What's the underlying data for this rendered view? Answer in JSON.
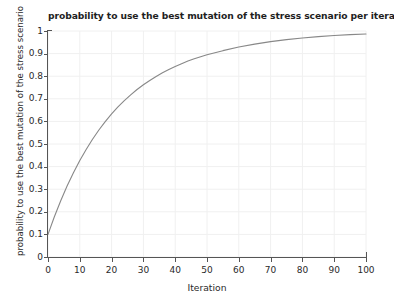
{
  "chart_data": {
    "type": "line",
    "title": "probability to use the best mutation of the stress scenario per iteration",
    "xlabel": "Iteration",
    "ylabel": "probability to use the best mutation of the stress scenario",
    "xlim": [
      0,
      100
    ],
    "ylim": [
      0,
      1
    ],
    "grid": true,
    "legend": "none",
    "line_color": "#888888",
    "xticks": [
      "0",
      "10",
      "20",
      "30",
      "40",
      "50",
      "60",
      "70",
      "80",
      "90",
      "100"
    ],
    "yticks": [
      "0",
      "0.1",
      "0.2",
      "0.3",
      "0.4",
      "0.5",
      "0.6",
      "0.7",
      "0.8",
      "0.9",
      "1"
    ],
    "series": [
      {
        "name": "probability to use the best mutation",
        "x": [
          0,
          2,
          4,
          6,
          8,
          10,
          12,
          14,
          16,
          18,
          20,
          22,
          24,
          26,
          28,
          30,
          32,
          34,
          36,
          38,
          40,
          42,
          44,
          46,
          48,
          50,
          55,
          60,
          65,
          70,
          75,
          80,
          85,
          90,
          95,
          100
        ],
        "values": [
          0.1,
          0.178,
          0.249,
          0.314,
          0.373,
          0.427,
          0.476,
          0.521,
          0.562,
          0.599,
          0.633,
          0.664,
          0.692,
          0.717,
          0.741,
          0.762,
          0.781,
          0.799,
          0.815,
          0.83,
          0.843,
          0.855,
          0.867,
          0.877,
          0.886,
          0.895,
          0.913,
          0.929,
          0.942,
          0.953,
          0.962,
          0.969,
          0.975,
          0.98,
          0.984,
          0.987
        ]
      }
    ]
  },
  "axes": {
    "x_label": "Iteration",
    "y_label": "probability to use the best mutation of the stress scenario"
  }
}
